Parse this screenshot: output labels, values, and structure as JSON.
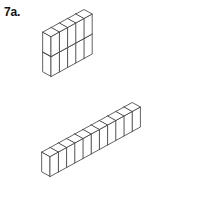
{
  "figure": {
    "label": "7a.",
    "background_color": "#ffffff",
    "line_color": "#3a3a3a",
    "face_color": "#ffffff",
    "line_width": 0.8,
    "width": 221,
    "height": 201,
    "projection": "isometric"
  },
  "geometry": {
    "cube_half_width": 8.2,
    "cube_rise": 4.5,
    "cube_height": 20
  },
  "structures": [
    {
      "name": "upper-wall",
      "origin_x": 43,
      "origin_y": 72,
      "length": 5,
      "height": 2,
      "depth": 1,
      "cube_count": 10
    },
    {
      "name": "lower-row",
      "origin_x": 42,
      "origin_y": 172,
      "length": 11,
      "height": 1,
      "depth": 1,
      "cube_count": 11
    }
  ]
}
